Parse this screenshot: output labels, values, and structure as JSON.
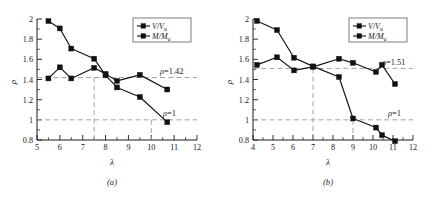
{
  "figure": {
    "panels": [
      {
        "caption": "(a)",
        "xlabel": "λ",
        "ylabel": "ρ",
        "legend": [
          {
            "label_main": "V/V",
            "label_sub": "u",
            "marker": "square-marker"
          },
          {
            "label_main": "M/M",
            "label_sub": "u",
            "marker": "square-marker"
          }
        ],
        "annotations": [
          {
            "text": "ρ=1.42",
            "value": 1.42
          },
          {
            "text": "ρ=1",
            "value": 1.0
          }
        ],
        "vlines": [
          7.5,
          10.0
        ]
      },
      {
        "caption": "(b)",
        "xlabel": "λ",
        "ylabel": "ρ",
        "legend": [
          {
            "label_main": "V/V",
            "label_sub": "u",
            "marker": "square-marker"
          },
          {
            "label_main": "M/M",
            "label_sub": "u",
            "marker": "square-marker"
          }
        ],
        "annotations": [
          {
            "text": "ρ=1.51",
            "value": 1.51
          },
          {
            "text": "ρ=1",
            "value": 1.0
          }
        ],
        "vlines": [
          7.0,
          9.0
        ]
      }
    ]
  },
  "chart_data": [
    {
      "type": "line",
      "title": "(a)",
      "xlabel": "λ",
      "ylabel": "ρ",
      "xlim": [
        5,
        12
      ],
      "ylim": [
        0.8,
        2.0
      ],
      "xticks": [
        5,
        6,
        7,
        8,
        9,
        10,
        11,
        12
      ],
      "yticks": [
        0.8,
        1.0,
        1.2,
        1.4,
        1.6,
        1.8,
        2.0
      ],
      "grid": false,
      "legend_position": "top-right",
      "reference_lines": [
        {
          "axis": "y",
          "value": 1.42,
          "label": "ρ=1.42",
          "style": "dashed"
        },
        {
          "axis": "y",
          "value": 1.0,
          "label": "ρ=1",
          "style": "dashed"
        },
        {
          "axis": "x",
          "value": 7.5,
          "label": "",
          "style": "dashed"
        },
        {
          "axis": "x",
          "value": 10.0,
          "label": "",
          "style": "dashed"
        }
      ],
      "series": [
        {
          "name": "V/Vu",
          "x": [
            5.5,
            6.0,
            6.5,
            7.5,
            8.0,
            8.5,
            9.5,
            10.7
          ],
          "y": [
            1.88,
            1.8,
            1.6,
            1.5,
            1.335,
            1.215,
            1.12,
            0.87
          ]
        },
        {
          "name": "M/Mu",
          "x": [
            5.5,
            6.0,
            6.5,
            7.5,
            8.0,
            8.5,
            9.5,
            10.7
          ],
          "y": [
            1.41,
            1.52,
            1.41,
            1.515,
            1.455,
            1.385,
            1.445,
            1.3
          ]
        }
      ]
    },
    {
      "type": "line",
      "title": "(b)",
      "xlabel": "λ",
      "ylabel": "ρ",
      "xlim": [
        4,
        12
      ],
      "ylim": [
        0.8,
        2.0
      ],
      "xticks": [
        4,
        5,
        6,
        7,
        8,
        9,
        10,
        11,
        12
      ],
      "yticks": [
        0.8,
        1.0,
        1.2,
        1.4,
        1.6,
        1.8,
        2.0
      ],
      "grid": false,
      "legend_position": "top-right",
      "reference_lines": [
        {
          "axis": "y",
          "value": 1.51,
          "label": "ρ=1.51",
          "style": "dashed"
        },
        {
          "axis": "y",
          "value": 1.0,
          "label": "ρ=1",
          "style": "dashed"
        },
        {
          "axis": "x",
          "value": 7.0,
          "label": "",
          "style": "dashed"
        },
        {
          "axis": "x",
          "value": 9.0,
          "label": "",
          "style": "dashed"
        }
      ],
      "series": [
        {
          "name": "V/Vu",
          "x": [
            4.2,
            5.2,
            6.05,
            7.0,
            8.3,
            9.0,
            10.15,
            10.45,
            11.1
          ],
          "y": [
            1.98,
            1.89,
            1.615,
            1.53,
            1.425,
            1.015,
            0.925,
            0.85,
            0.79
          ]
        },
        {
          "name": "M/Mu",
          "x": [
            4.2,
            5.2,
            6.05,
            7.0,
            8.3,
            9.0,
            10.15,
            10.45,
            11.1
          ],
          "y": [
            1.545,
            1.62,
            1.49,
            1.525,
            1.605,
            1.565,
            1.475,
            1.545,
            1.355
          ]
        }
      ]
    }
  ]
}
